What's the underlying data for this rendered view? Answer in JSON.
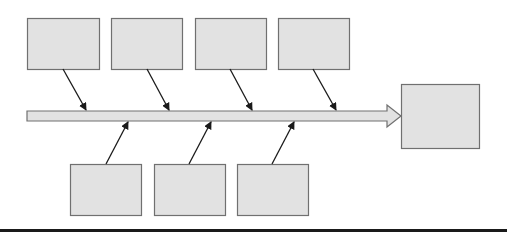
{
  "diagram": {
    "type": "fishbone",
    "colors": {
      "box_fill": "#e2e2e2",
      "box_stroke": "#707070",
      "arrow_stroke": "#1a1a1a",
      "spine_fill": "#e2e2e2",
      "spine_stroke": "#707070",
      "background": "#ffffff",
      "bottom_bar": "#1a1a1a"
    },
    "spine": {
      "x1": 27,
      "y_top": 111,
      "y_bottom": 121,
      "shaft_end": 387,
      "head_tip_x": 401,
      "head_top": 105,
      "head_bottom": 127
    },
    "effect_box": {
      "x": 401,
      "y": 84,
      "w": 78,
      "h": 64,
      "label": ""
    },
    "cause_boxes_top": [
      {
        "x": 27,
        "y": 18,
        "w": 72,
        "h": 51,
        "label": ""
      },
      {
        "x": 111,
        "y": 18,
        "w": 71,
        "h": 51,
        "label": ""
      },
      {
        "x": 195,
        "y": 18,
        "w": 71,
        "h": 51,
        "label": ""
      },
      {
        "x": 278,
        "y": 18,
        "w": 71,
        "h": 51,
        "label": ""
      }
    ],
    "cause_boxes_bottom": [
      {
        "x": 70,
        "y": 164,
        "w": 71,
        "h": 51,
        "label": ""
      },
      {
        "x": 154,
        "y": 164,
        "w": 71,
        "h": 51,
        "label": ""
      },
      {
        "x": 237,
        "y": 164,
        "w": 71,
        "h": 51,
        "label": ""
      }
    ],
    "arrows_top": [
      {
        "x1": 63,
        "y1": 69,
        "x2": 86,
        "y2": 110
      },
      {
        "x1": 147,
        "y1": 69,
        "x2": 169,
        "y2": 110
      },
      {
        "x1": 230,
        "y1": 69,
        "x2": 252,
        "y2": 110
      },
      {
        "x1": 313,
        "y1": 69,
        "x2": 336,
        "y2": 110
      }
    ],
    "arrows_bottom": [
      {
        "x1": 106,
        "y1": 164,
        "x2": 128,
        "y2": 122
      },
      {
        "x1": 189,
        "y1": 164,
        "x2": 211,
        "y2": 122
      },
      {
        "x1": 272,
        "y1": 164,
        "x2": 294,
        "y2": 122
      }
    ]
  }
}
